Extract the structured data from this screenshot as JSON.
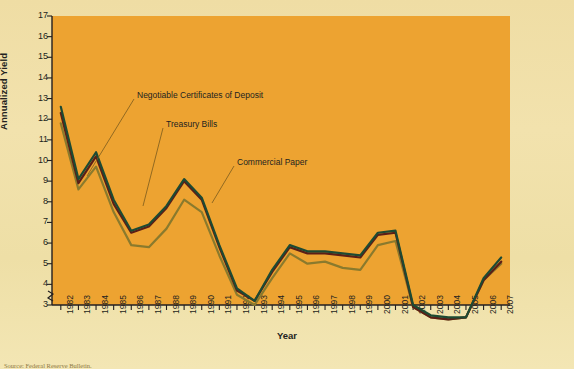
{
  "page": {
    "background_color": "#efdda4",
    "plot_background_color": "#eda331",
    "showthrough_text_1": "ILLUSTRATION",
    "showthrough_text_2": "ILLUSTRATION",
    "showthrough_title": "Managed Rate Funds",
    "source_note": "Source: Federal Reserve Bulletin."
  },
  "chart_data": {
    "type": "line",
    "title": "",
    "xlabel": "Year",
    "ylabel": "Annualized Yield",
    "ylim": [
      3,
      17
    ],
    "yticks": [
      17,
      16,
      15,
      14,
      13,
      12,
      11,
      10,
      9,
      8,
      7,
      6,
      5,
      4,
      3
    ],
    "axis_break": true,
    "grid": false,
    "legend_position": "inline-annotations",
    "x": [
      1982,
      1983,
      1984,
      1985,
      1986,
      1987,
      1988,
      1989,
      1990,
      1991,
      1992,
      1993,
      1994,
      1995,
      1996,
      1997,
      1998,
      1999,
      2000,
      2001,
      2002,
      2003,
      2004,
      2005,
      2006,
      2007
    ],
    "categories": [
      "1982",
      "1983",
      "1984",
      "1985",
      "1986",
      "1987",
      "1988",
      "1989",
      "1990",
      "1991",
      "1992",
      "1993",
      "1994",
      "1995",
      "1996",
      "1997",
      "1998",
      "1999",
      "2000",
      "2001",
      "2002",
      "2003",
      "2004",
      "2005",
      "2006",
      "2007"
    ],
    "series": [
      {
        "name": "Negotiable Certificates of Deposit",
        "color": "#1d4a33",
        "values": [
          12.6,
          9.1,
          10.4,
          8.1,
          6.6,
          6.9,
          7.8,
          9.1,
          8.2,
          5.9,
          3.8,
          3.2,
          4.7,
          5.9,
          5.6,
          5.6,
          5.5,
          5.4,
          6.5,
          6.6,
          3.0,
          2.5,
          2.4,
          2.4,
          4.3,
          5.3
        ],
        "style": "solid"
      },
      {
        "name": "Commercial Paper",
        "color": "#5c1e17",
        "values": [
          12.3,
          8.9,
          10.2,
          7.9,
          6.5,
          6.8,
          7.7,
          9.0,
          8.1,
          5.8,
          3.7,
          3.2,
          4.6,
          5.8,
          5.5,
          5.5,
          5.4,
          5.3,
          6.4,
          6.5,
          2.9,
          2.4,
          2.3,
          2.4,
          4.2,
          5.1
        ],
        "style": "solid"
      },
      {
        "name": "Treasury Bills",
        "color": "#8a7a2d",
        "values": [
          11.8,
          8.6,
          9.7,
          7.5,
          5.9,
          5.8,
          6.7,
          8.1,
          7.5,
          5.4,
          3.5,
          3.0,
          4.3,
          5.5,
          5.0,
          5.1,
          4.8,
          4.7,
          5.9,
          6.1,
          2.9,
          2.4,
          2.3,
          2.4,
          4.2,
          5.0
        ],
        "style": "solid"
      }
    ],
    "annotations": [
      {
        "text": "Negotiable Certificates of Deposit",
        "x": 137,
        "y": 96,
        "leader_to_x": 87,
        "leader_to_y": 176
      },
      {
        "text": "Treasury Bills",
        "x": 166,
        "y": 125,
        "leader_to_x": 143,
        "leader_to_y": 206
      },
      {
        "text": "Commercial Paper",
        "x": 237,
        "y": 163,
        "leader_to_x": 212,
        "leader_to_y": 203
      }
    ]
  }
}
